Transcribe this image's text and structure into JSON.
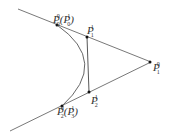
{
  "diagram": {
    "labels": {
      "p0": "P",
      "p0_sub": "0",
      "p0_sup": "0",
      "p0_paren": "(P",
      "p0_paren_sub": "0",
      "p0_paren_sup": "1",
      "p0_close": ")",
      "p1a": "P",
      "p1a_sub": "1",
      "p1a_sup": "1",
      "p1b": "P",
      "p1b_sub": "1",
      "p1b_sup": "0",
      "p2a": "P",
      "p2a_sub": "2",
      "p2a_sup": "1",
      "p2": "P",
      "p2_sub": "2",
      "p2_sup": "0",
      "p2_paren": "(P",
      "p2_paren_sub": "3",
      "p2_paren_sup": "1",
      "p2_close": ")"
    },
    "colors": {
      "line": "#444444",
      "point": "#111111"
    }
  }
}
